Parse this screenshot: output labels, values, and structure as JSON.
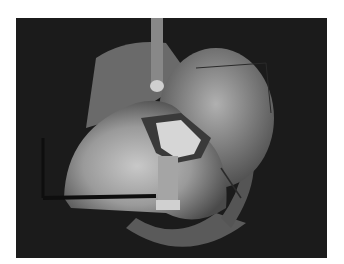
{
  "image": {
    "description": "Grayscale intraoperative photograph of an exposed heart with a retractor blade at top and a surgical clamp/instrument near the center; a light rectangular patch sits on the surface",
    "colors": {
      "background": "#ffffff",
      "field": "#1a1a1a",
      "tissue_light": "#bdbdbd",
      "tissue_mid": "#8a8a8a",
      "patch": "#d8d8d8"
    }
  }
}
